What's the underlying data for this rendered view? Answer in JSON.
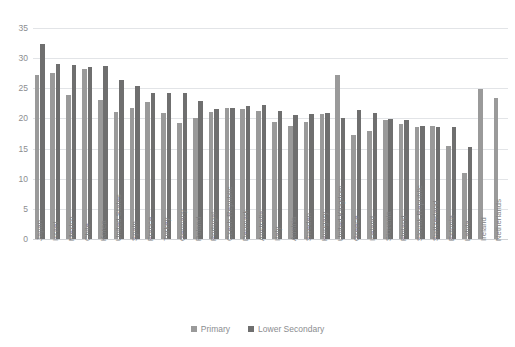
{
  "chart_data": {
    "type": "bar",
    "title": "",
    "subtitle": "",
    "xlabel": "",
    "ylabel": "",
    "ylim": [
      0,
      35
    ],
    "ytick_step": 5,
    "yticks": [
      0,
      5,
      10,
      15,
      20,
      25,
      30,
      35
    ],
    "grid": true,
    "legend_position": "bottom",
    "categories": [
      "Japan",
      "Israel",
      "Mexico",
      "Chile",
      "Korea",
      "United States",
      "Spain",
      "France",
      "Turkey",
      "Germany",
      "Poland",
      "Portugal",
      "Czech Republic",
      "Denmark",
      "Australia",
      "Italy",
      "Austria",
      "Sweden",
      "Hungary",
      "United Kingdom",
      "Greece",
      "Iceland",
      "Slovenia",
      "Finland",
      "Slovak Republic",
      "Switzerland",
      "Estonia",
      "Latvia",
      "Ireland",
      "Netherlands"
    ],
    "series": [
      {
        "name": "Primary",
        "color": "#9a9a9a",
        "values": [
          27.2,
          27.5,
          23.9,
          28.2,
          23.1,
          21.1,
          21.8,
          22.8,
          20.9,
          19.3,
          20.0,
          21.1,
          21.7,
          21.6,
          21.3,
          19.4,
          18.7,
          19.4,
          20.8,
          27.2,
          17.3,
          18.0,
          19.7,
          19.1,
          18.5,
          18.8,
          15.4,
          11.0,
          24.9,
          23.4
        ]
      },
      {
        "name": "Lower Secondary",
        "color": "#6f6f6f",
        "values": [
          32.3,
          29.0,
          28.9,
          28.6,
          28.7,
          26.4,
          25.3,
          24.3,
          24.2,
          24.2,
          22.9,
          21.6,
          21.8,
          22.0,
          22.2,
          21.3,
          20.5,
          20.7,
          20.9,
          20.0,
          21.4,
          20.9,
          19.9,
          19.8,
          18.8,
          18.6,
          18.6,
          15.3,
          null,
          null
        ]
      }
    ]
  },
  "legend": {
    "items": [
      {
        "label": "Primary",
        "color": "#9a9a9a"
      },
      {
        "label": "Lower Secondary",
        "color": "#6f6f6f"
      }
    ]
  },
  "colors": {
    "background": "#ffffff",
    "gridline": "#e2e4e7",
    "axis": "#d0d2d5",
    "tick_text": "#8b8d90",
    "primary": "#9a9a9a",
    "lower_secondary": "#6f6f6f"
  }
}
